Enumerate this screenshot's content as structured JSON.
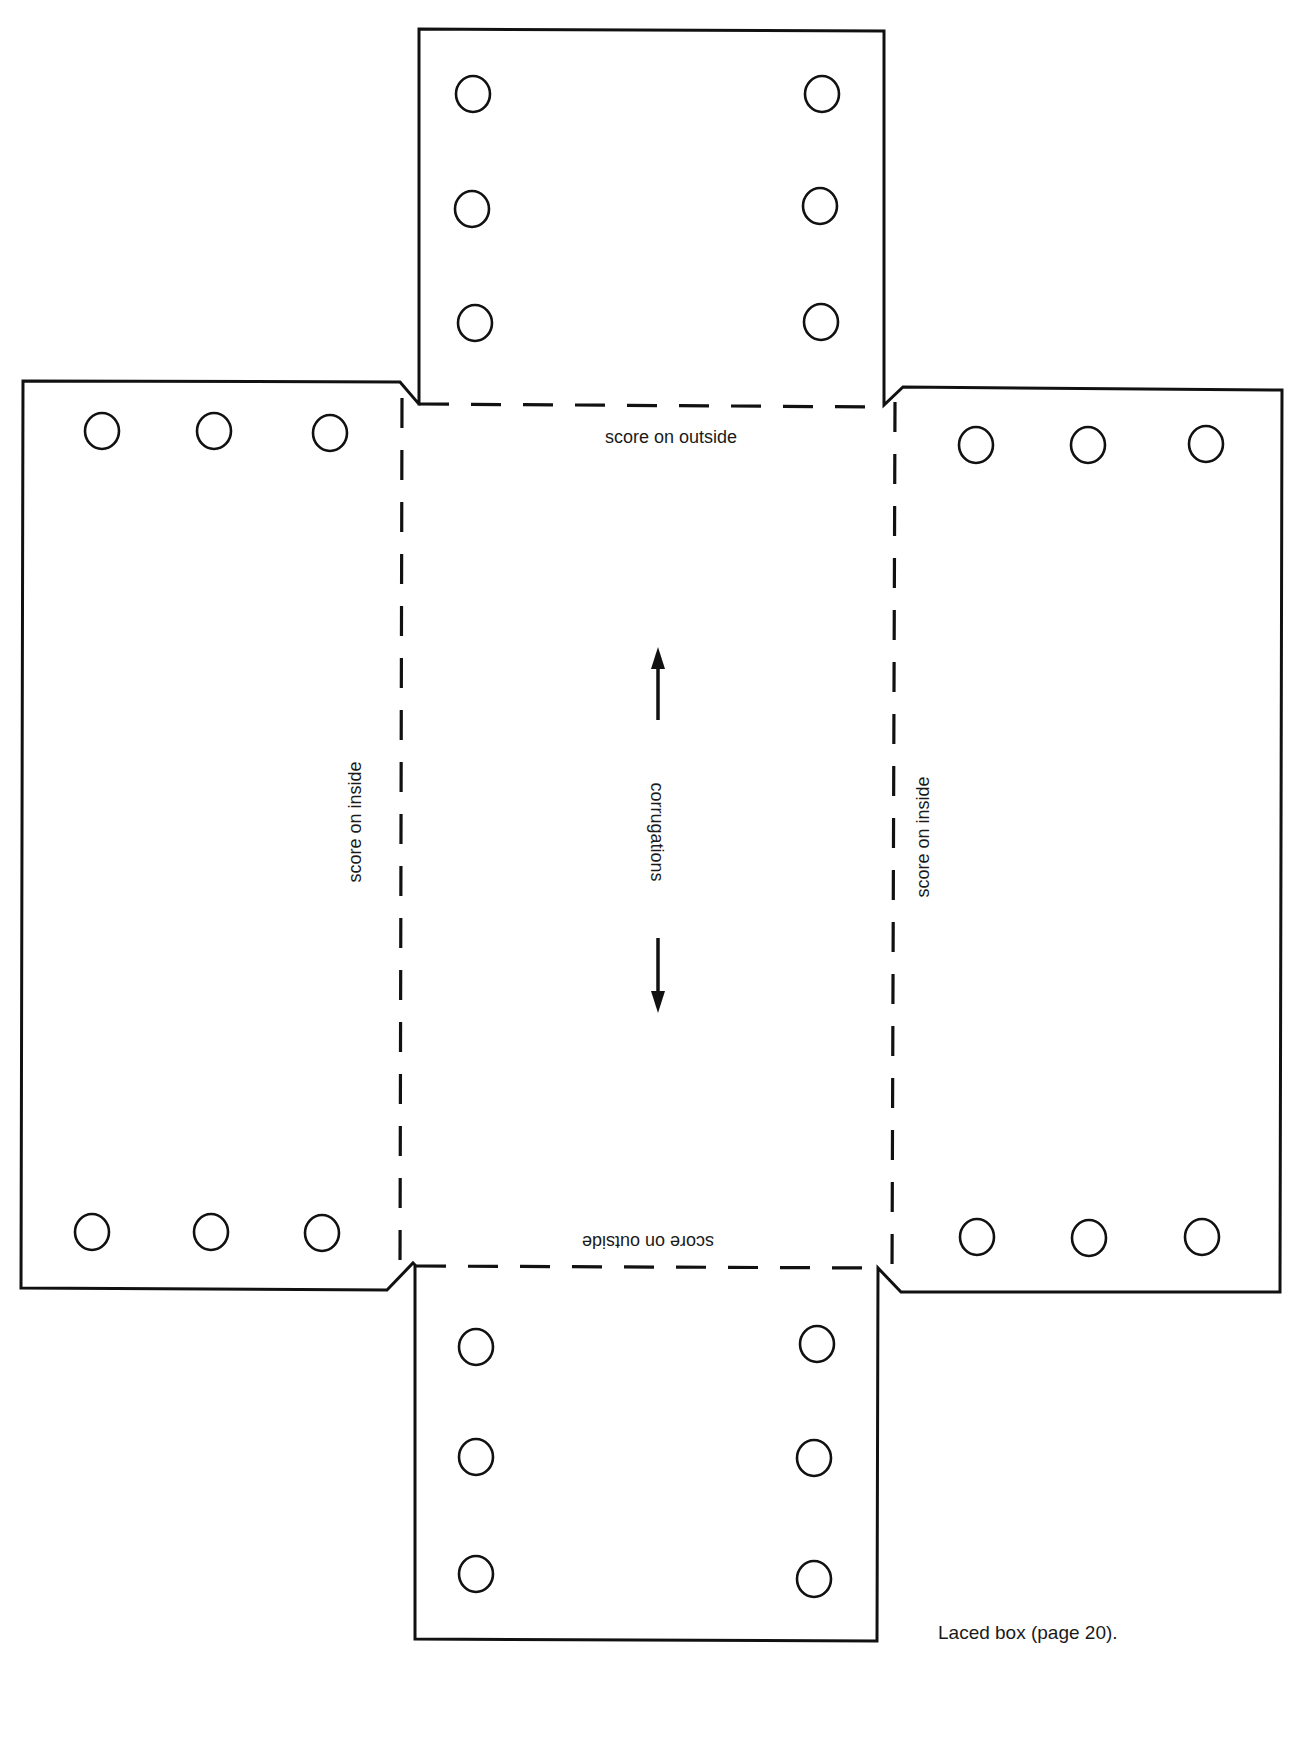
{
  "diagram": {
    "caption": "Laced box (page 20).",
    "labels": {
      "top_fold": "score on outside",
      "bottom_fold": "score on outside",
      "left_fold": "score on inside",
      "right_fold": "score on inside",
      "center": "corrugations"
    },
    "colors": {
      "line": "#111111",
      "background": "#ffffff"
    },
    "panels": {
      "top_flap": {
        "holes": [
          [
            473,
            94
          ],
          [
            472,
            209
          ],
          [
            475,
            323
          ],
          [
            822,
            94
          ],
          [
            820,
            206
          ],
          [
            821,
            322
          ]
        ]
      },
      "left_flap": {
        "holes": [
          [
            102,
            431
          ],
          [
            214,
            431
          ],
          [
            330,
            433
          ],
          [
            92,
            1232
          ],
          [
            211,
            1232
          ],
          [
            322,
            1233
          ]
        ]
      },
      "right_flap": {
        "holes": [
          [
            976,
            445
          ],
          [
            1088,
            445
          ],
          [
            1206,
            444
          ],
          [
            977,
            1237
          ],
          [
            1089,
            1238
          ],
          [
            1202,
            1237
          ]
        ]
      },
      "bottom_flap": {
        "holes": [
          [
            476,
            1347
          ],
          [
            476,
            1457
          ],
          [
            476,
            1574
          ],
          [
            817,
            1344
          ],
          [
            814,
            1458
          ],
          [
            814,
            1579
          ]
        ]
      }
    },
    "hole_radius": 17
  }
}
